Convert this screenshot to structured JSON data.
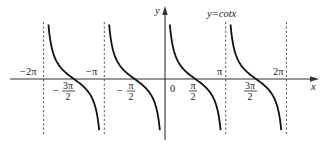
{
  "chart_data": {
    "type": "line",
    "title": "y=cotx",
    "xlabel": "x",
    "ylabel": "y",
    "function": "cot(x)",
    "xlim_pi": [
      -2.5,
      2.6
    ],
    "asymptotes": [
      "-2π",
      "-π",
      "0",
      "π",
      "2π"
    ],
    "asymptotes_value": [
      -6.2832,
      -3.1416,
      0,
      3.1416,
      6.2832
    ],
    "zeros": [
      "-3π/2",
      "-π/2",
      "π/2",
      "3π/2"
    ],
    "zeros_value": [
      -4.7124,
      -1.5708,
      1.5708,
      4.7124
    ],
    "branches": [
      {
        "from": "-2π",
        "to": "-π"
      },
      {
        "from": "-π",
        "to": "0"
      },
      {
        "from": "0",
        "to": "π"
      },
      {
        "from": "π",
        "to": "2π"
      }
    ],
    "tick_labels_above": [
      "-2π",
      "-π",
      "π",
      "2π"
    ],
    "tick_labels_below": [
      "-3π/2",
      "-π/2",
      "0",
      "π/2",
      "3π/2"
    ],
    "asymptote_style": "dashed",
    "grid": false,
    "legend": false
  },
  "labels": {
    "title": "y=cotx",
    "x_axis": "x",
    "y_axis": "y",
    "origin": "0",
    "neg_two_pi": "−2π",
    "neg_pi": "−π",
    "pi": "π",
    "two_pi": "2π",
    "neg_three_pi_half": {
      "sign": "−",
      "num": "3π",
      "den": "2"
    },
    "neg_pi_half": {
      "sign": "−",
      "num": "π",
      "den": "2"
    },
    "pi_half": {
      "num": "π",
      "den": "2"
    },
    "three_pi_half": {
      "num": "3π",
      "den": "2"
    }
  },
  "geometry": {
    "origin_x": 165,
    "axis_y": 79,
    "px_per_pi": 60.7,
    "y_scale": 14,
    "y_top": 24,
    "y_bottom": 131
  }
}
